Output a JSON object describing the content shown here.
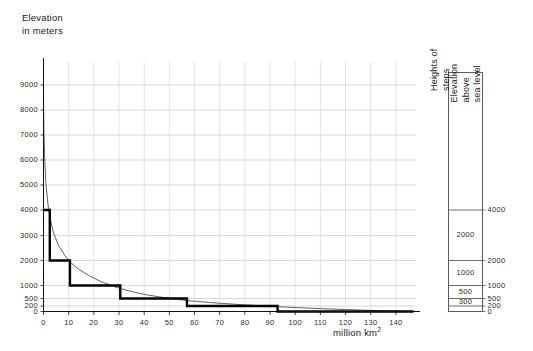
{
  "figure": {
    "yaxis_title": "Elevation\nin meters",
    "xaxis_title_text": "million km",
    "xaxis_title_exponent": "2"
  },
  "panel": {
    "caption_steps": "Heights of\nsteps",
    "caption_elevation": "Elevation\nabove\nsea level",
    "step_labels": [
      "2000",
      "1000",
      "500",
      "300"
    ],
    "scale_labels": [
      "4000",
      "2000",
      "1000",
      "500",
      "200",
      "0"
    ]
  },
  "chart_data": {
    "type": "area",
    "title": "",
    "subtitle": "",
    "xlabel": "million km2",
    "ylabel": "Elevation in meters",
    "grid": true,
    "legend_position": "none",
    "xlim": [
      0,
      148
    ],
    "ylim": [
      0,
      9500
    ],
    "x_ticks": [
      0,
      10,
      20,
      30,
      40,
      50,
      60,
      70,
      80,
      90,
      100,
      110,
      120,
      130,
      140
    ],
    "y_ticks": [
      0,
      200,
      500,
      1000,
      2000,
      3000,
      4000,
      5000,
      6000,
      7000,
      8000,
      9000
    ],
    "y_tick_labels": [
      "0",
      "200",
      "500",
      "1000",
      "2000",
      "3000",
      "4000",
      "5000",
      "6000",
      "7000",
      "8000",
      "9000"
    ],
    "series": [
      {
        "name": "Hypsographic curve",
        "type": "line",
        "points": [
          [
            0.0,
            8400
          ],
          [
            0.2,
            7000
          ],
          [
            0.5,
            6000
          ],
          [
            1.0,
            5000
          ],
          [
            1.8,
            4200
          ],
          [
            2.8,
            3600
          ],
          [
            4.0,
            3100
          ],
          [
            6.0,
            2600
          ],
          [
            8.5,
            2200
          ],
          [
            11.0,
            1900
          ],
          [
            14.0,
            1650
          ],
          [
            18.0,
            1400
          ],
          [
            23.0,
            1150
          ],
          [
            28.0,
            960
          ],
          [
            34.0,
            790
          ],
          [
            41.0,
            640
          ],
          [
            49.0,
            520
          ],
          [
            57.0,
            420
          ],
          [
            66.0,
            340
          ],
          [
            76.0,
            270
          ],
          [
            87.0,
            205
          ],
          [
            93.0,
            175
          ],
          [
            100.0,
            145
          ],
          [
            110.0,
            105
          ],
          [
            120.0,
            70
          ],
          [
            130.0,
            40
          ],
          [
            140.0,
            15
          ],
          [
            148.0,
            0
          ]
        ]
      },
      {
        "name": "Step approximation",
        "type": "step",
        "steps": [
          {
            "x_start": 0.0,
            "x_end": 2.5,
            "value": 4000
          },
          {
            "x_start": 2.5,
            "x_end": 10.5,
            "value": 2000
          },
          {
            "x_start": 10.5,
            "x_end": 30.5,
            "value": 1000
          },
          {
            "x_start": 30.5,
            "x_end": 57.0,
            "value": 500
          },
          {
            "x_start": 57.0,
            "x_end": 93.0,
            "value": 200
          },
          {
            "x_start": 93.0,
            "x_end": 147.0,
            "value": 0
          }
        ]
      }
    ],
    "step_panel": {
      "description": "Heights of steps vs elevation above sea level",
      "bands": [
        {
          "step_height": "",
          "top_elevation": 9500,
          "bottom_elevation": 4000
        },
        {
          "step_height": "2000",
          "top_elevation": 4000,
          "bottom_elevation": 2000
        },
        {
          "step_height": "1000",
          "top_elevation": 2000,
          "bottom_elevation": 1000
        },
        {
          "step_height": "500",
          "top_elevation": 1000,
          "bottom_elevation": 500
        },
        {
          "step_height": "300",
          "top_elevation": 500,
          "bottom_elevation": 200
        },
        {
          "step_height": "",
          "top_elevation": 200,
          "bottom_elevation": 0
        }
      ]
    }
  }
}
